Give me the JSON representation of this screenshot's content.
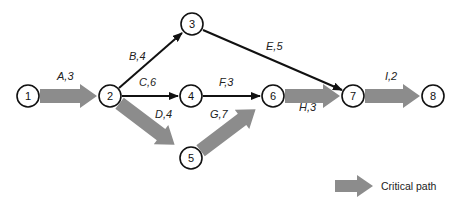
{
  "diagram": {
    "type": "activity-on-arrow network",
    "colors": {
      "critical": "#8c8c8c",
      "normal": "#111111",
      "node_stroke": "#111111",
      "background": "#ffffff"
    },
    "nodes": [
      {
        "id": "1",
        "label": "1",
        "x": 28,
        "y": 96
      },
      {
        "id": "2",
        "label": "2",
        "x": 110,
        "y": 96
      },
      {
        "id": "3",
        "label": "3",
        "x": 192,
        "y": 24
      },
      {
        "id": "4",
        "label": "4",
        "x": 191,
        "y": 96
      },
      {
        "id": "5",
        "label": "5",
        "x": 191,
        "y": 158
      },
      {
        "id": "6",
        "label": "6",
        "x": 273,
        "y": 96
      },
      {
        "id": "7",
        "label": "7",
        "x": 353,
        "y": 96
      },
      {
        "id": "8",
        "label": "8",
        "x": 433,
        "y": 96
      }
    ],
    "activities": [
      {
        "label": "A,3",
        "from": "1",
        "to": "2",
        "critical": true
      },
      {
        "label": "B,4",
        "from": "2",
        "to": "3",
        "critical": false
      },
      {
        "label": "C,6",
        "from": "2",
        "to": "4",
        "critical": false
      },
      {
        "label": "D,4",
        "from": "2",
        "to": "5",
        "critical": true
      },
      {
        "label": "E,5",
        "from": "3",
        "to": "7",
        "critical": false
      },
      {
        "label": "F,3",
        "from": "4",
        "to": "6",
        "critical": false
      },
      {
        "label": "G,7",
        "from": "5",
        "to": "6",
        "critical": true
      },
      {
        "label": "H,3",
        "from": "6",
        "to": "7",
        "critical": true
      },
      {
        "label": "I,2",
        "from": "7",
        "to": "8",
        "critical": true
      }
    ]
  },
  "legend": {
    "critical_label": "Critical path"
  }
}
